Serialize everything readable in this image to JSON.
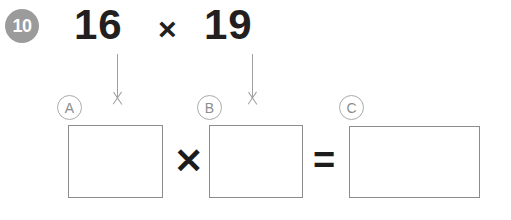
{
  "worksheet": {
    "question_number": "10",
    "problem": {
      "left_factor": "16",
      "operator": "×",
      "right_factor": "19"
    },
    "arrows": [
      {
        "label": "arrow-to-box-a",
        "direction": "down"
      },
      {
        "label": "arrow-to-box-b",
        "direction": "down"
      }
    ],
    "answer_row": {
      "boxes": [
        {
          "letter": "A",
          "value": ""
        },
        {
          "letter": "B",
          "value": ""
        },
        {
          "letter": "C",
          "value": ""
        }
      ],
      "operator_multiply": "✕",
      "operator_equals": "="
    },
    "colors": {
      "badge_background": "#9b9b9b",
      "badge_text": "#ffffff",
      "number_text": "#231f20",
      "arrow": "#a0a0a0",
      "letter_circle_border": "#aaaaaa",
      "letter_circle_text": "#8d8d8d",
      "box_border": "#8c8c8c",
      "page_background": "#ffffff"
    }
  }
}
